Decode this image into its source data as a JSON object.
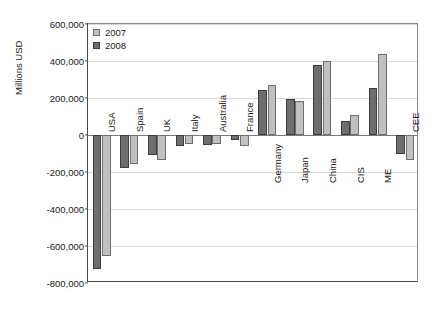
{
  "chart_data": {
    "type": "bar",
    "title": "",
    "subtitle": "",
    "xlabel": "",
    "ylabel": "Millions USD",
    "ylim": [
      -800000,
      600000
    ],
    "ytick_values": [
      600000,
      400000,
      200000,
      0,
      -200000,
      -400000,
      -600000,
      -800000
    ],
    "ytick_labels": [
      "600,000",
      "400,000",
      "200,000",
      "0",
      "-200,000",
      "-400,000",
      "-600,000",
      "-800,000"
    ],
    "grid": true,
    "legend_position": "top-left",
    "categories": [
      "USA",
      "Spain",
      "UK",
      "Italy",
      "Australia",
      "France",
      "Germany",
      "Japan",
      "China",
      "CIS",
      "ME",
      "CEE"
    ],
    "series": [
      {
        "name": "2007",
        "color": "#c0c0c0",
        "values": [
          -655000,
          -155000,
          -135000,
          -50000,
          -48000,
          -62000,
          270000,
          185000,
          400000,
          110000,
          440000,
          -135000
        ]
      },
      {
        "name": "2008",
        "color": "#6e6e6e",
        "values": [
          -725000,
          -178000,
          -108000,
          -60000,
          -55000,
          -25000,
          245000,
          195000,
          380000,
          75000,
          255000,
          -105000
        ]
      }
    ]
  },
  "legend": {
    "entries": [
      {
        "label": "2007"
      },
      {
        "label": "2008"
      }
    ]
  }
}
